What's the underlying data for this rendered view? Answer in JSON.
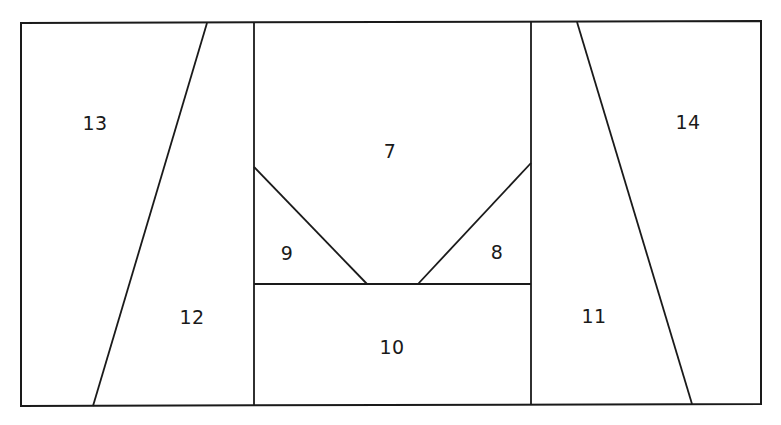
{
  "figure": {
    "background_color": "#ffffff",
    "stroke_color": "#1a1a1a",
    "fill_color": "#ffffff",
    "canvas": {
      "width": 781,
      "height": 425
    }
  },
  "outline": {
    "name": "outer-rectangle",
    "corners": {
      "top_left": [
        21,
        23
      ],
      "top_right": [
        761,
        21
      ],
      "bottom_right": [
        761,
        404
      ],
      "bottom_left": [
        21,
        406
      ]
    }
  },
  "edges": [
    {
      "name": "left-slant-edge",
      "from": [
        207,
        23
      ],
      "to": [
        93,
        406
      ]
    },
    {
      "name": "right-slant-edge",
      "from": [
        577,
        22
      ],
      "to": [
        692,
        404
      ]
    },
    {
      "name": "left-vertical-edge",
      "from": [
        254,
        23
      ],
      "to": [
        254,
        405
      ]
    },
    {
      "name": "right-vertical-edge",
      "from": [
        531,
        22
      ],
      "to": [
        531,
        405
      ]
    },
    {
      "name": "vee-left-arm-edge",
      "from": [
        254,
        167
      ],
      "to": [
        367,
        284
      ]
    },
    {
      "name": "vee-right-arm-edge",
      "from": [
        531,
        163
      ],
      "to": [
        418,
        284
      ]
    },
    {
      "name": "middle-horizontal-edge",
      "from": [
        254,
        284
      ],
      "to": [
        531,
        284
      ]
    }
  ],
  "regions": [
    {
      "id": "region-7",
      "label": "7",
      "label_x": 390,
      "label_y": 152
    },
    {
      "id": "region-8",
      "label": "8",
      "label_x": 497,
      "label_y": 253
    },
    {
      "id": "region-9",
      "label": "9",
      "label_x": 287,
      "label_y": 254
    },
    {
      "id": "region-10",
      "label": "10",
      "label_x": 392,
      "label_y": 348
    },
    {
      "id": "region-11",
      "label": "11",
      "label_x": 594,
      "label_y": 317
    },
    {
      "id": "region-12",
      "label": "12",
      "label_x": 192,
      "label_y": 318
    },
    {
      "id": "region-13",
      "label": "13",
      "label_x": 95,
      "label_y": 124
    },
    {
      "id": "region-14",
      "label": "14",
      "label_x": 688,
      "label_y": 123
    }
  ]
}
